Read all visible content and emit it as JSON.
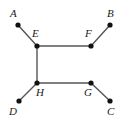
{
  "figure": {
    "name": "graph-diagram",
    "width": 129,
    "height": 126,
    "background_color": "#ffffff",
    "edge_color": "#555555",
    "node_color": "#111111",
    "label_color": "#1b1b1b"
  },
  "chart_data": {
    "type": "diagram",
    "title": "",
    "nodes": [
      {
        "id": "A",
        "label": "A",
        "x": 18,
        "y": 25,
        "kind": "leaf",
        "label_x": 10,
        "label_y": 8
      },
      {
        "id": "B",
        "label": "B",
        "x": 110,
        "y": 25,
        "kind": "leaf",
        "label_x": 107,
        "label_y": 8
      },
      {
        "id": "C",
        "label": "C",
        "x": 110,
        "y": 101,
        "kind": "leaf",
        "label_x": 107,
        "label_y": 106
      },
      {
        "id": "D",
        "label": "D",
        "x": 19,
        "y": 101,
        "kind": "leaf",
        "label_x": 9,
        "label_y": 106
      },
      {
        "id": "E",
        "label": "E",
        "x": 37,
        "y": 46,
        "kind": "internal",
        "label_x": 32,
        "label_y": 28
      },
      {
        "id": "F",
        "label": "F",
        "x": 91,
        "y": 46,
        "kind": "internal",
        "label_x": 85,
        "label_y": 28
      },
      {
        "id": "G",
        "label": "G",
        "x": 91,
        "y": 83,
        "kind": "internal",
        "label_x": 84,
        "label_y": 87
      },
      {
        "id": "H",
        "label": "H",
        "x": 37,
        "y": 83,
        "kind": "internal",
        "label_x": 36,
        "label_y": 87
      }
    ],
    "edges": [
      {
        "from": "A",
        "to": "E"
      },
      {
        "from": "B",
        "to": "F"
      },
      {
        "from": "E",
        "to": "F"
      },
      {
        "from": "E",
        "to": "H"
      },
      {
        "from": "H",
        "to": "G"
      },
      {
        "from": "G",
        "to": "C"
      },
      {
        "from": "D",
        "to": "H"
      }
    ],
    "node_radius": 2.6,
    "edge_width": 1.4
  }
}
